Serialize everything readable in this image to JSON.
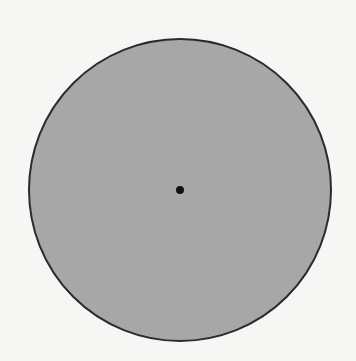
{
  "diagram": {
    "shape": "circle",
    "center": {
      "x": 180,
      "y": 190
    },
    "radius": 151,
    "fill_color": "#a6a6a6",
    "stroke_color": "#2b2b2b",
    "stroke_width": 2,
    "background_color": "#f6f6f5",
    "center_point": {
      "x": 180,
      "y": 190,
      "radius": 4,
      "color": "#111111"
    }
  }
}
